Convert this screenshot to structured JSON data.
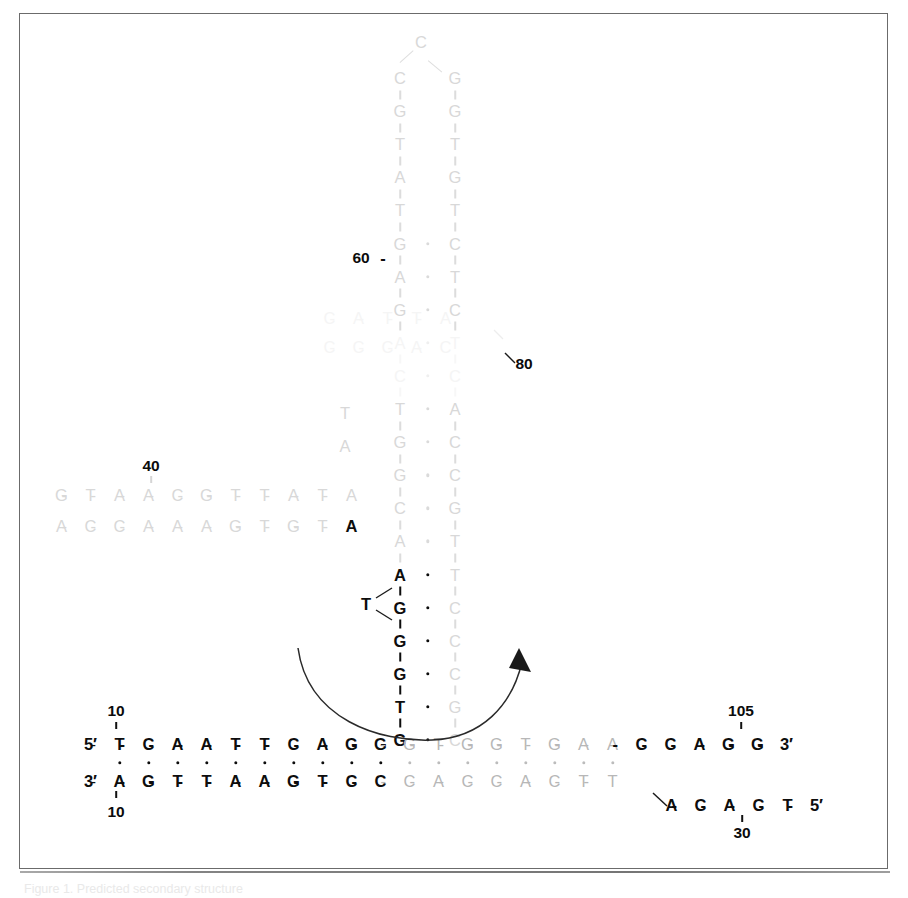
{
  "figure": {
    "kind": "nucleic-acid-secondary-structure-diagram",
    "caption": "Figure 1. Predicted secondary structure"
  },
  "labels": {
    "five_prime": "5′",
    "three_prime": "3′",
    "n10_top": "10",
    "n10_bottom": "10",
    "n30": "30",
    "n40": "40",
    "n60": "60",
    "n80": "80",
    "n105": "105"
  },
  "bottom_duplex": {
    "top_strand_prefix": "5′",
    "bottom_strand_prefix": "3′",
    "top_strand_suffix": "3′",
    "top_bases": [
      "T",
      "C",
      "A",
      "A",
      "T",
      "T",
      "C",
      "A",
      "G",
      "G",
      "G",
      "T",
      "G",
      "G",
      "T",
      "G",
      "A",
      "A",
      "C",
      "C",
      "A",
      "G",
      "G"
    ],
    "bottom_bases": [
      "A",
      "G",
      "T",
      "T",
      "A",
      "A",
      "G",
      "T",
      "C",
      "C",
      "C",
      "A",
      "C",
      "C",
      "A",
      "C",
      "T",
      "T"
    ],
    "top_shade": [
      "dark",
      "dark",
      "dark",
      "dark",
      "dark",
      "dark",
      "dark",
      "dark",
      "dark",
      "dark",
      "mid",
      "mid",
      "mid",
      "mid",
      "mid",
      "mid",
      "mid",
      "mid",
      "dark",
      "dark",
      "dark",
      "dark",
      "dark"
    ],
    "bottom_shade": [
      "dark",
      "dark",
      "dark",
      "dark",
      "dark",
      "dark",
      "dark",
      "dark",
      "dark",
      "dark",
      "mid",
      "mid",
      "mid",
      "mid",
      "mid",
      "mid",
      "mid",
      "mid"
    ]
  },
  "tail_strand": {
    "bases": [
      "A",
      "C",
      "A",
      "C",
      "T"
    ],
    "suffix": "5′"
  },
  "left_arm": {
    "upper_bases": [
      "G",
      "T",
      "A",
      "A",
      "C",
      "G",
      "T",
      "T",
      "A",
      "T",
      "A"
    ],
    "lower_bases": [
      "A",
      "C",
      "C",
      "A",
      "A",
      "A",
      "G",
      "T",
      "G",
      "T"
    ],
    "lower_tail_base": "A"
  },
  "mid_branch": {
    "upper_bases": [
      "C",
      "A",
      "T",
      "T",
      "A"
    ],
    "lower_bases": [
      "C",
      "C",
      "C",
      "A",
      "C"
    ]
  },
  "stem": {
    "left_column": [
      {
        "base": "C",
        "shade": "light"
      },
      {
        "base": "G",
        "shade": "light"
      },
      {
        "base": "T",
        "shade": "light"
      },
      {
        "base": "A",
        "shade": "light"
      },
      {
        "base": "T",
        "shade": "light"
      },
      {
        "base": "G",
        "shade": "light"
      },
      {
        "base": "A",
        "shade": "light"
      },
      {
        "base": "G",
        "shade": "light"
      },
      {
        "base": "A",
        "shade": "vghost"
      },
      {
        "base": "C",
        "shade": "vghost"
      },
      {
        "base": "T",
        "shade": "light"
      },
      {
        "base": "G",
        "shade": "light"
      },
      {
        "base": "G",
        "shade": "light"
      },
      {
        "base": "C",
        "shade": "light"
      },
      {
        "base": "A",
        "shade": "light"
      },
      {
        "base": "A",
        "shade": "dark"
      },
      {
        "base": "G",
        "shade": "dark"
      },
      {
        "base": "G",
        "shade": "dark"
      },
      {
        "base": "G",
        "shade": "dark"
      },
      {
        "base": "T",
        "shade": "dark"
      },
      {
        "base": "G",
        "shade": "dark"
      }
    ],
    "right_column": [
      {
        "base": "G",
        "shade": "light"
      },
      {
        "base": "G",
        "shade": "light"
      },
      {
        "base": "T",
        "shade": "light"
      },
      {
        "base": "G",
        "shade": "light"
      },
      {
        "base": "T",
        "shade": "light"
      },
      {
        "base": "C",
        "shade": "light"
      },
      {
        "base": "T",
        "shade": "light"
      },
      {
        "base": "C",
        "shade": "light"
      },
      {
        "base": "T",
        "shade": "vghost"
      },
      {
        "base": "C",
        "shade": "vghost"
      },
      {
        "base": "A",
        "shade": "light"
      },
      {
        "base": "C",
        "shade": "light"
      },
      {
        "base": "C",
        "shade": "light"
      },
      {
        "base": "G",
        "shade": "light"
      },
      {
        "base": "T",
        "shade": "light"
      },
      {
        "base": "T",
        "shade": "light"
      },
      {
        "base": "C",
        "shade": "light"
      },
      {
        "base": "C",
        "shade": "light"
      },
      {
        "base": "C",
        "shade": "light"
      },
      {
        "base": "G",
        "shade": "light"
      },
      {
        "base": "C",
        "shade": "light"
      }
    ],
    "apex_base": "C",
    "branch_base_T": "T",
    "branch_base_left_T": "T",
    "branch_base_left_A": "A"
  }
}
